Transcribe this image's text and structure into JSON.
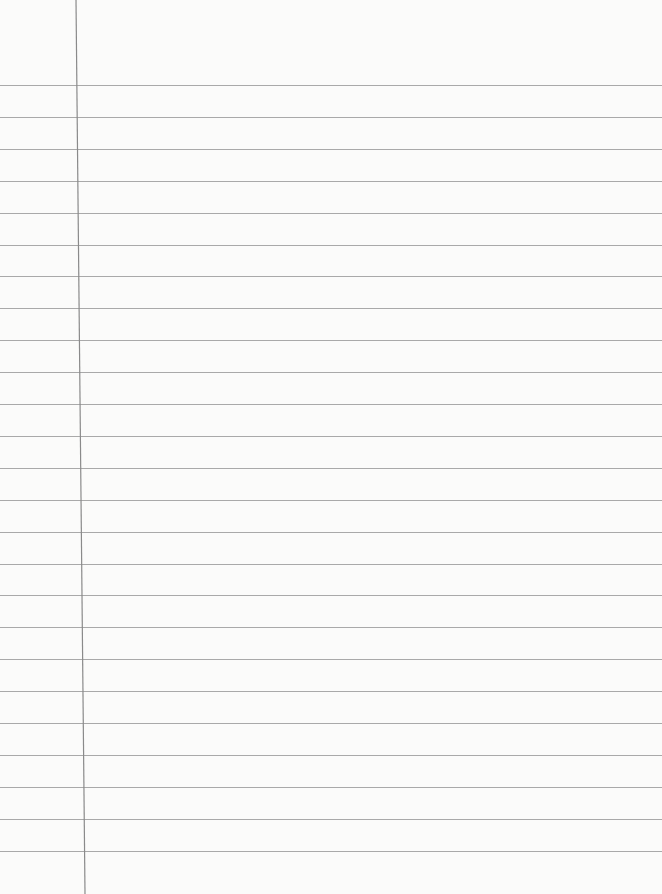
{
  "paper": {
    "type": "lined-notebook-paper",
    "background_color": "#fbfbfa",
    "rule_color": "#9a9a9a",
    "margin_line_color": "#8a8a8a",
    "rule_count": 25,
    "first_rule_y": 85,
    "rule_spacing": 31.9,
    "margin_line": {
      "x_top": 76,
      "x_bottom": 85
    }
  }
}
